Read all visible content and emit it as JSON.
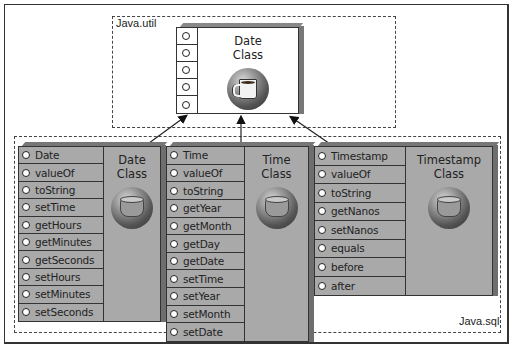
{
  "diagram": {
    "packages": {
      "util": {
        "label": "Java.util"
      },
      "sql": {
        "label": "Java.sql"
      }
    },
    "base_class": {
      "title_line1": "Date",
      "title_line2": "Class",
      "icon": "coffee-cup-icon",
      "method_slots": 5
    },
    "classes": [
      {
        "id": "date",
        "title_line1": "Date",
        "title_line2": "Class",
        "icon": "cylinder-icon",
        "methods": [
          "Date",
          "valueOf",
          "toString",
          "setTime",
          "getHours",
          "getMinutes",
          "getSeconds",
          "setHours",
          "setMinutes",
          "setSeconds"
        ]
      },
      {
        "id": "time",
        "title_line1": "Time",
        "title_line2": "Class",
        "icon": "cylinder-icon",
        "methods": [
          "Time",
          "valueOf",
          "toString",
          "getYear",
          "getMonth",
          "getDay",
          "getDate",
          "setTime",
          "setYear",
          "setMonth",
          "setDate"
        ]
      },
      {
        "id": "timestamp",
        "title_line1": "Timestamp",
        "title_line2": "Class",
        "icon": "cylinder-icon",
        "methods": [
          "Timestamp",
          "valueOf",
          "toString",
          "getNanos",
          "setNanos",
          "equals",
          "before",
          "after"
        ]
      }
    ],
    "relations": [
      {
        "from": "Date (Java.sql)",
        "to": "Date (Java.util)",
        "type": "inherits"
      },
      {
        "from": "Time",
        "to": "Date (Java.util)",
        "type": "inherits"
      },
      {
        "from": "Timestamp",
        "to": "Date (Java.util)",
        "type": "inherits"
      }
    ]
  }
}
